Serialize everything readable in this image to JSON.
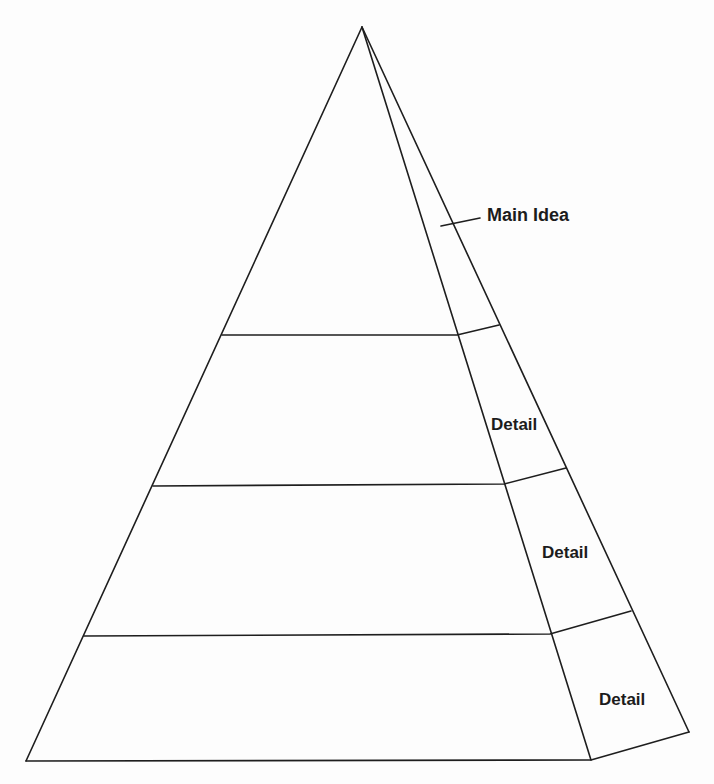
{
  "diagram": {
    "type": "pyramid",
    "levels": 4,
    "labels": {
      "main_idea": "Main Idea",
      "detail_1": "Detail",
      "detail_2": "Detail",
      "detail_3": "Detail"
    },
    "colors": {
      "line": "#1e1e1e",
      "text": "#1c1c1c",
      "background": "#fdfdfd"
    }
  }
}
